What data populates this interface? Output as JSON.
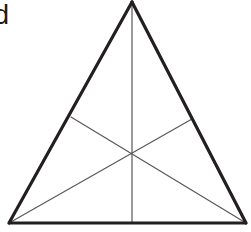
{
  "figure": {
    "label": "d",
    "label_note": "partially cropped at left edge",
    "caption": "",
    "background_color": "#ffffff",
    "outline_color": "#231f20",
    "interior_line_color": "#58585a",
    "outline_width": 3,
    "interior_line_width": 1,
    "canvas": {
      "width": 251,
      "height": 232
    },
    "vertices": {
      "apex": {
        "name": "apex",
        "x": 132,
        "y": 2
      },
      "bottom_left": {
        "name": "bottom-left",
        "x": 9,
        "y": 223
      },
      "bottom_right": {
        "name": "bottom-right",
        "x": 246,
        "y": 223
      },
      "centroid": {
        "name": "centroid",
        "x": 132,
        "y": 152
      },
      "left_side_midpoint": {
        "name": "left-side-midpoint",
        "x": 71,
        "y": 117
      },
      "right_side_midpoint": {
        "name": "right-side-midpoint",
        "x": 192,
        "y": 119
      }
    },
    "outline_segments": [
      {
        "name": "left-side",
        "x1": 132,
        "y1": 2,
        "x2": 9,
        "y2": 223
      },
      {
        "name": "right-side",
        "x1": 132,
        "y1": 2,
        "x2": 246,
        "y2": 223
      },
      {
        "name": "base",
        "x1": 9,
        "y1": 223,
        "x2": 246,
        "y2": 223
      }
    ],
    "interior_segments": [
      {
        "name": "median-apex-to-base",
        "x1": 132,
        "y1": 2,
        "x2": 132,
        "y2": 223
      },
      {
        "name": "median-left-midpoint-to-bottom-right",
        "x1": 71,
        "y1": 117,
        "x2": 246,
        "y2": 223
      },
      {
        "name": "median-right-midpoint-to-bottom-left",
        "x1": 192,
        "y1": 119,
        "x2": 9,
        "y2": 223
      }
    ]
  }
}
